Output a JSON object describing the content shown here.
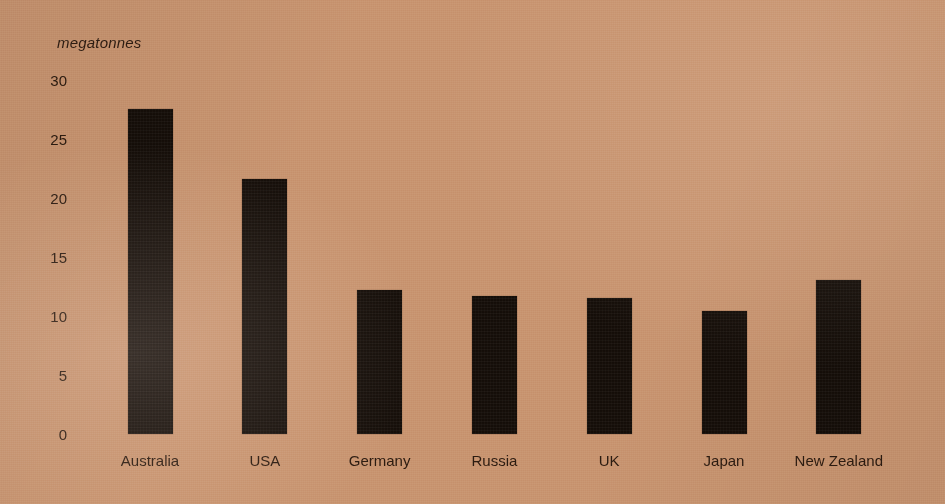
{
  "chart_data": {
    "type": "bar",
    "title": "",
    "subtitle": "",
    "xlabel": "",
    "ylabel": "megatonnes",
    "categories": [
      "Australia",
      "USA",
      "Germany",
      "Russia",
      "UK",
      "Japan",
      "New Zealand"
    ],
    "values": [
      27.5,
      21.6,
      12.2,
      11.7,
      11.5,
      10.4,
      13.0
    ],
    "ytick_labels": [
      "30",
      "25",
      "20",
      "15",
      "10",
      "5",
      "0"
    ],
    "ytick_values": [
      30,
      25,
      20,
      15,
      10,
      5,
      0
    ],
    "ylim": [
      0,
      30
    ],
    "grid": false,
    "legend": false,
    "legend_position": "none",
    "bar_color": "#140d08",
    "background_color": "#c89470",
    "text_color": "#2b1b10"
  }
}
